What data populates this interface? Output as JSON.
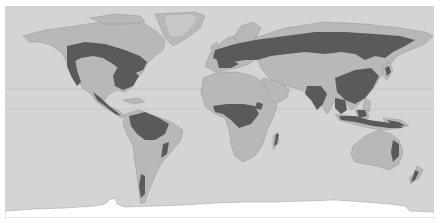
{
  "map": {
    "type": "world-map",
    "projection": "equirectangular",
    "style": "grayscale",
    "colors": {
      "ocean": "#d4d4d4",
      "land": "#b8b8b8",
      "forest": "#5a5a5a",
      "ice": "#ffffff",
      "latitude_line": "#c2c2c2",
      "border": "#ffffff"
    },
    "layers": [
      "ocean",
      "land",
      "forest-cover",
      "ice",
      "latitude-lines"
    ],
    "latitude_lines": [
      "tropic-of-cancer",
      "equator"
    ]
  }
}
